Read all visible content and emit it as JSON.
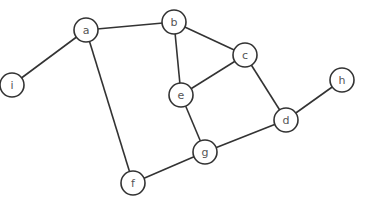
{
  "graph": {
    "nodes": [
      {
        "id": "a",
        "label": "a",
        "x": 86,
        "y": 30
      },
      {
        "id": "b",
        "label": "b",
        "x": 174,
        "y": 22
      },
      {
        "id": "c",
        "label": "c",
        "x": 245,
        "y": 55
      },
      {
        "id": "d",
        "label": "d",
        "x": 286,
        "y": 120
      },
      {
        "id": "e",
        "label": "e",
        "x": 181,
        "y": 95
      },
      {
        "id": "f",
        "label": "f",
        "x": 133,
        "y": 183
      },
      {
        "id": "g",
        "label": "g",
        "x": 205,
        "y": 152
      },
      {
        "id": "h",
        "label": "h",
        "x": 342,
        "y": 80
      },
      {
        "id": "i",
        "label": "i",
        "x": 12,
        "y": 85
      }
    ],
    "edges": [
      [
        "a",
        "b"
      ],
      [
        "a",
        "i"
      ],
      [
        "a",
        "f"
      ],
      [
        "b",
        "c"
      ],
      [
        "b",
        "e"
      ],
      [
        "c",
        "e"
      ],
      [
        "c",
        "d"
      ],
      [
        "d",
        "h"
      ],
      [
        "d",
        "g"
      ],
      [
        "e",
        "g"
      ],
      [
        "g",
        "f"
      ]
    ],
    "node_radius": 12
  }
}
